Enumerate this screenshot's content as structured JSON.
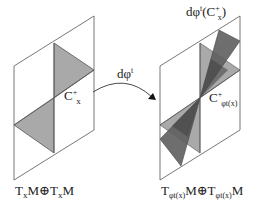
{
  "diagram": {
    "left_space": {
      "label_parts": [
        "T",
        "x",
        "M",
        "⊕",
        "T",
        "x",
        "M"
      ],
      "cone_label": {
        "base": "C",
        "sup": "+",
        "sub": "x"
      }
    },
    "map": {
      "label": {
        "base": "dφ",
        "sup": "t"
      }
    },
    "right_space": {
      "label_parts": [
        "T",
        "φt(x)",
        "M",
        "⊕",
        "T",
        "φt(x)",
        "M"
      ],
      "cone_label": {
        "base": "C",
        "sup": "+",
        "sub": "φt(x)"
      },
      "image_cone_label": {
        "prefix": "dφ",
        "sup": "t",
        "open": "(C",
        "inner_sup": "+",
        "inner_sub": "x",
        "close": ")"
      }
    },
    "colors": {
      "outline": "#555555",
      "cone_fill": "#a9a9a9",
      "image_cone_fill": "#5e5e5e",
      "image_cone_overlap": "#3f3f3f"
    }
  }
}
